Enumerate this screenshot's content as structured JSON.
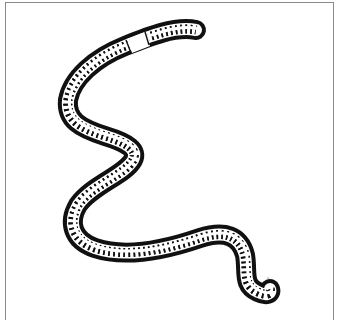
{
  "image": {
    "subject": "earthworm line drawing",
    "description": "Black outline illustration of an earthworm with segmented ring markings and a plain band (clitellum) near the head, curving in an S-shape from top-right to bottom-right, inside a thin gray frame.",
    "colors": {
      "outline": "#111111",
      "body_fill": "#ffffff",
      "frame": "#8a8a8a",
      "background": "#ffffff"
    }
  }
}
